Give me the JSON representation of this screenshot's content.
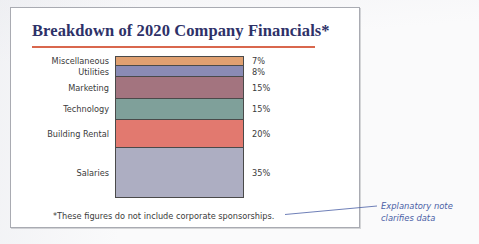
{
  "slide": {
    "title": "Breakdown of 2020 Company Financials*",
    "footnote": "*These figures do not include corporate sponsorships."
  },
  "annotation": {
    "line1": "Explanatory note",
    "line2": "clarifies data",
    "color": "#4a5fa6"
  },
  "colors": {
    "title": "#2e3168",
    "title_rule": "#d9674d",
    "frame": "#a9abb2",
    "bar_outline": "#4a4a4a"
  },
  "chart_data": {
    "type": "bar",
    "orientation": "horizontal-stacked-column",
    "title": "Breakdown of 2020 Company Financials*",
    "xlabel": "",
    "ylabel": "",
    "categories": [
      "Miscellaneous",
      "Utilities",
      "Marketing",
      "Technology",
      "Building Rental",
      "Salaries"
    ],
    "values": [
      7,
      8,
      15,
      15,
      20,
      35
    ],
    "value_labels": [
      "7%",
      "8%",
      "15%",
      "15%",
      "20%",
      "35%"
    ],
    "unit": "%",
    "total": 100,
    "grid": false,
    "legend": "none",
    "segment_colors": [
      "#e0a071",
      "#8a8bb5",
      "#a3747f",
      "#7fa09a",
      "#e2796f",
      "#adaec2"
    ]
  }
}
